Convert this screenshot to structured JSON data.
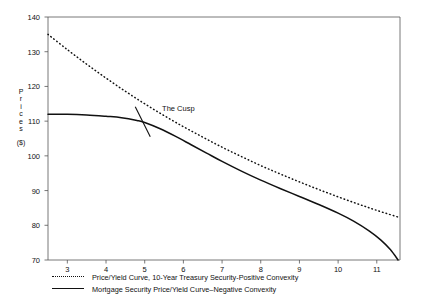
{
  "chart_data": {
    "type": "line",
    "title": "",
    "subtitle": "",
    "xlabel": "",
    "ylabel": "Prices ($)",
    "ylabel_chars": [
      "P",
      "r",
      "i",
      "c",
      "e",
      "s"
    ],
    "ylabel_unit": "($)",
    "xlim": [
      2.5,
      11.6
    ],
    "ylim": [
      70,
      140
    ],
    "xticks": [
      3,
      4,
      5,
      6,
      7,
      8,
      9,
      10,
      11
    ],
    "yticks": [
      70,
      80,
      90,
      100,
      110,
      120,
      130,
      140
    ],
    "grid": false,
    "legend_position": "below-axes-left",
    "annotations": [
      {
        "text": "The Cusp",
        "x": 5.45,
        "y": 113.5,
        "marker": "diagonal-tick-cross"
      }
    ],
    "series": [
      {
        "name": "Price/Yield Curve, 10-Year Treasury Security-Positive Convexity",
        "style": "dotted",
        "color": "#111111",
        "x": [
          2.5,
          3.0,
          3.5,
          4.0,
          4.5,
          5.0,
          5.5,
          6.0,
          6.5,
          7.0,
          7.5,
          8.0,
          8.5,
          9.0,
          9.5,
          10.0,
          10.5,
          11.0,
          11.6
        ],
        "y": [
          135.0,
          130.6,
          126.4,
          122.4,
          118.6,
          115.0,
          111.6,
          108.4,
          105.4,
          102.5,
          99.8,
          97.2,
          94.8,
          92.5,
          90.3,
          88.2,
          86.2,
          84.3,
          82.2
        ]
      },
      {
        "name": "Mortgage Security Price/Yield Curve–Negative Convexity",
        "style": "solid",
        "color": "#111111",
        "x": [
          2.5,
          3.0,
          3.5,
          4.0,
          4.4,
          4.8,
          5.0,
          5.4,
          5.8,
          6.2,
          6.6,
          7.0,
          7.5,
          8.0,
          8.5,
          9.0,
          9.5,
          10.0,
          10.4,
          10.8,
          11.1,
          11.35,
          11.55
        ],
        "y": [
          112.0,
          112.0,
          111.8,
          111.4,
          111.0,
          110.2,
          109.6,
          107.8,
          105.6,
          103.2,
          100.8,
          98.4,
          95.6,
          93.0,
          90.6,
          88.3,
          86.0,
          83.5,
          81.2,
          78.4,
          75.8,
          73.0,
          70.0
        ]
      }
    ]
  },
  "legend": {
    "items": [
      {
        "key": "dotted-line-key",
        "label": "Price/Yield Curve, 10-Year Treasury Security-Positive Convexity"
      },
      {
        "key": "solid-line-key",
        "label": "Mortgage Security Price/Yield Curve–Negative Convexity"
      }
    ]
  },
  "colors": {
    "ink": "#111111",
    "axis": "#555555",
    "background": "#ffffff"
  }
}
